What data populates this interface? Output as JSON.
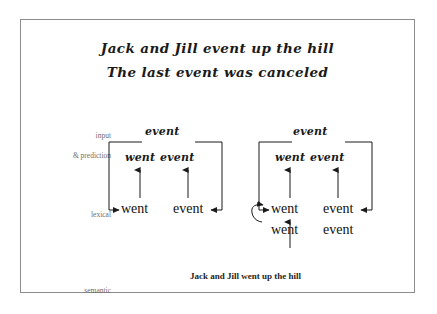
{
  "figure": {
    "title": {
      "line1": "Jack and Jill event up the hill",
      "line2": "The last event was canceled"
    },
    "row_labels": {
      "input": "input",
      "prediction": "& prediction",
      "lexical": "lexical",
      "semantic": "semantic"
    },
    "caption": "Jack and Jill went up the hill",
    "colors": {
      "frame_border": "#8c8c8c",
      "ink": "#1a1a1a",
      "label_gray": "#6e6e6e",
      "background": "#ffffff"
    },
    "blocks": [
      {
        "id": "left",
        "input_token": "event",
        "prediction_tokens": [
          "went",
          "event"
        ],
        "lexical_rows": [
          {
            "tokens": [
              "went",
              "event"
            ]
          }
        ],
        "has_recurrent_curve": false,
        "has_semantic_arrow": false
      },
      {
        "id": "right",
        "input_token": "event",
        "prediction_tokens": [
          "went",
          "event"
        ],
        "lexical_rows": [
          {
            "tokens": [
              "went",
              "event"
            ]
          },
          {
            "tokens": [
              "went",
              "event"
            ]
          }
        ],
        "has_recurrent_curve": true,
        "has_semantic_arrow": true
      }
    ]
  }
}
